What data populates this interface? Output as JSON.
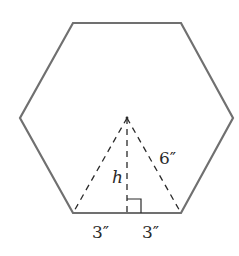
{
  "diagram": {
    "colors": {
      "outline": "#707070",
      "dashed": "#2a2a2a",
      "text": "#2a2a2a",
      "background": "#ffffff"
    },
    "hexagon": {
      "vertices": [
        [
          73,
          23
        ],
        [
          181,
          23
        ],
        [
          233,
          118
        ],
        [
          181,
          213
        ],
        [
          73,
          213
        ],
        [
          20,
          118
        ]
      ]
    },
    "center": [
      127,
      118
    ],
    "labels": {
      "height": "h",
      "slant_side": "6″",
      "left_base": "3″",
      "right_base": "3″"
    }
  }
}
